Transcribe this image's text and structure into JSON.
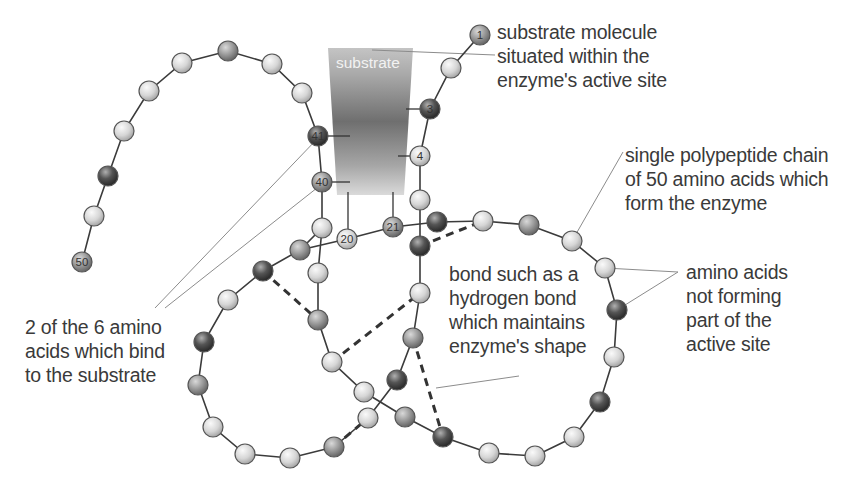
{
  "colors": {
    "chain_line": "#3b3b3b",
    "bead_light": "#d9d9d9",
    "bead_mid": "#a8a8a8",
    "bead_dark": "#4a4a4a",
    "leader_line": "#8c8c8c",
    "bond_dash": "#333333",
    "substrate_top": "#bdbdbd",
    "substrate_mid": "#6e6e6e",
    "substrate_bottom": "#d8d8d8",
    "text": "#3a3a3a"
  },
  "substrate": {
    "label": "substrate",
    "shape": [
      [
        328,
        48
      ],
      [
        413,
        48
      ],
      [
        404,
        195
      ],
      [
        337,
        195
      ]
    ]
  },
  "labels": {
    "substrate_molecule": "substrate molecule\nsituated within the\nenzyme's active site",
    "polypeptide_chain": "single polypeptide chain\nof 50 amino acids which\nform the enzyme",
    "amino_acids_not_forming": "amino acids\nnot forming\npart of the\nactive site",
    "binding_amino_acids": "2 of the 6 amino\nacids which bind\nto the substrate",
    "hydrogen_bond": "bond such as a\nhydrogen bond\nwhich maintains\nenzyme's shape"
  },
  "numbered_residues": [
    {
      "num": "1",
      "x": 480,
      "y": 35,
      "shade": "mid"
    },
    {
      "num": "3",
      "x": 430,
      "y": 109,
      "shade": "dark"
    },
    {
      "num": "4",
      "x": 420,
      "y": 156,
      "shade": "light"
    },
    {
      "num": "20",
      "x": 347,
      "y": 239,
      "shade": "light"
    },
    {
      "num": "21",
      "x": 393,
      "y": 227,
      "shade": "mid"
    },
    {
      "num": "40",
      "x": 322,
      "y": 182,
      "shade": "mid"
    },
    {
      "num": "41",
      "x": 318,
      "y": 136,
      "shade": "dark"
    },
    {
      "num": "50",
      "x": 82,
      "y": 262,
      "shade": "mid"
    }
  ],
  "chain_path": [
    [
      480,
      35
    ],
    [
      451,
      68
    ],
    [
      430,
      109
    ],
    [
      420,
      156
    ],
    [
      420,
      200
    ],
    [
      420,
      233
    ],
    [
      420,
      278
    ],
    [
      414,
      337
    ],
    [
      401,
      381
    ],
    [
      390,
      412
    ],
    [
      366,
      442
    ],
    [
      334,
      446
    ],
    [
      290,
      458
    ],
    [
      244,
      453
    ],
    [
      212,
      427
    ],
    [
      198,
      385
    ],
    [
      204,
      343
    ],
    [
      228,
      300
    ],
    [
      263,
      272
    ],
    [
      300,
      250
    ],
    [
      347,
      239
    ],
    [
      393,
      227
    ],
    [
      437,
      222
    ],
    [
      483,
      221
    ],
    [
      529,
      225
    ],
    [
      572,
      241
    ],
    [
      604,
      269
    ],
    [
      616,
      310
    ],
    [
      613,
      357
    ],
    [
      600,
      402
    ],
    [
      574,
      437
    ],
    [
      528,
      455
    ],
    [
      481,
      453
    ],
    [
      441,
      437
    ],
    [
      403,
      417
    ],
    [
      364,
      392
    ],
    [
      331,
      363
    ],
    [
      318,
      320
    ],
    [
      318,
      275
    ],
    [
      322,
      228
    ],
    [
      322,
      182
    ],
    [
      318,
      136
    ],
    [
      302,
      93
    ],
    [
      272,
      64
    ],
    [
      228,
      51
    ],
    [
      182,
      63
    ],
    [
      149,
      91
    ],
    [
      124,
      131
    ],
    [
      108,
      176
    ],
    [
      94,
      216
    ],
    [
      82,
      262
    ]
  ],
  "beads": [
    {
      "x": 451,
      "y": 68,
      "shade": "light"
    },
    {
      "x": 420,
      "y": 200,
      "shade": "light"
    },
    {
      "x": 420,
      "y": 246,
      "shade": "dark"
    },
    {
      "x": 437,
      "y": 222,
      "shade": "dark"
    },
    {
      "x": 483,
      "y": 221,
      "shade": "light"
    },
    {
      "x": 529,
      "y": 225,
      "shade": "mid"
    },
    {
      "x": 572,
      "y": 241,
      "shade": "light"
    },
    {
      "x": 605,
      "y": 268,
      "shade": "light"
    },
    {
      "x": 617,
      "y": 310,
      "shade": "dark"
    },
    {
      "x": 614,
      "y": 357,
      "shade": "light"
    },
    {
      "x": 600,
      "y": 402,
      "shade": "dark"
    },
    {
      "x": 574,
      "y": 437,
      "shade": "light"
    },
    {
      "x": 535,
      "y": 456,
      "shade": "light"
    },
    {
      "x": 489,
      "y": 453,
      "shade": "light"
    },
    {
      "x": 443,
      "y": 437,
      "shade": "dark"
    },
    {
      "x": 405,
      "y": 417,
      "shade": "mid"
    },
    {
      "x": 364,
      "y": 392,
      "shade": "light"
    },
    {
      "x": 332,
      "y": 362,
      "shade": "light"
    },
    {
      "x": 318,
      "y": 320,
      "shade": "mid"
    },
    {
      "x": 318,
      "y": 273,
      "shade": "light"
    },
    {
      "x": 322,
      "y": 228,
      "shade": "light"
    },
    {
      "x": 420,
      "y": 293,
      "shade": "light"
    },
    {
      "x": 413,
      "y": 338,
      "shade": "mid"
    },
    {
      "x": 397,
      "y": 380,
      "shade": "dark"
    },
    {
      "x": 368,
      "y": 418,
      "shade": "light"
    },
    {
      "x": 334,
      "y": 447,
      "shade": "mid"
    },
    {
      "x": 290,
      "y": 458,
      "shade": "light"
    },
    {
      "x": 245,
      "y": 454,
      "shade": "light"
    },
    {
      "x": 213,
      "y": 427,
      "shade": "light"
    },
    {
      "x": 198,
      "y": 385,
      "shade": "mid"
    },
    {
      "x": 204,
      "y": 342,
      "shade": "dark"
    },
    {
      "x": 228,
      "y": 300,
      "shade": "light"
    },
    {
      "x": 263,
      "y": 271,
      "shade": "dark"
    },
    {
      "x": 300,
      "y": 250,
      "shade": "mid"
    },
    {
      "x": 302,
      "y": 93,
      "shade": "light"
    },
    {
      "x": 272,
      "y": 64,
      "shade": "light"
    },
    {
      "x": 228,
      "y": 51,
      "shade": "mid"
    },
    {
      "x": 182,
      "y": 63,
      "shade": "light"
    },
    {
      "x": 149,
      "y": 91,
      "shade": "light"
    },
    {
      "x": 124,
      "y": 131,
      "shade": "light"
    },
    {
      "x": 108,
      "y": 176,
      "shade": "dark"
    },
    {
      "x": 94,
      "y": 216,
      "shade": "light"
    }
  ],
  "hydrogen_bonds": [
    [
      [
        263,
        271
      ],
      [
        318,
        320
      ]
    ],
    [
      [
        420,
        246
      ],
      [
        483,
        221
      ]
    ],
    [
      [
        332,
        362
      ],
      [
        420,
        293
      ]
    ],
    [
      [
        413,
        338
      ],
      [
        443,
        437
      ]
    ],
    [
      [
        334,
        447
      ],
      [
        368,
        418
      ]
    ]
  ]
}
